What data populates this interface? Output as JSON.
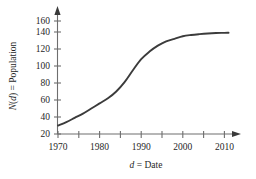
{
  "chart_data": {
    "type": "line",
    "title": "",
    "subtitle": "",
    "xlabel_parts": {
      "variable": "d",
      "equals": " = ",
      "noun": "Date"
    },
    "xlabel": "d = Date",
    "ylabel_parts": {
      "func": "N",
      "open": "(",
      "variable": "d",
      "close": ")",
      "equals": " = ",
      "noun": "Population"
    },
    "ylabel": "N(d) = Population",
    "x": [
      1970,
      1972,
      1974,
      1976,
      1978,
      1980,
      1982,
      1984,
      1986,
      1988,
      1990,
      1992,
      1994,
      1996,
      1998,
      2000,
      2002,
      2004,
      2006,
      2008,
      2010,
      2011
    ],
    "values": [
      30,
      34,
      39,
      44,
      50,
      56,
      62,
      70,
      81,
      95,
      108,
      117,
      124,
      129,
      132,
      135,
      136.5,
      137.5,
      138.3,
      138.8,
      139,
      139.2
    ],
    "xlim": [
      1970,
      2014
    ],
    "ylim": [
      20,
      168
    ],
    "xticks_major": [
      1970,
      1980,
      1990,
      2000,
      2010
    ],
    "xticks_minor": [
      1975,
      1985,
      1995,
      2005
    ],
    "xtick_labels": [
      "1970",
      "1980",
      "1990",
      "2000",
      "2010"
    ],
    "yticks": [
      20,
      40,
      60,
      80,
      100,
      120,
      140,
      160
    ],
    "ytick_labels": [
      "20",
      "40",
      "60",
      "80",
      "100",
      "120",
      "140",
      "160"
    ],
    "grid": false,
    "legend": null,
    "series_color": "#3b3b3b",
    "axis_color": "#6e6e6e",
    "curve_shape": "logistic sigmoid",
    "annotations": []
  }
}
